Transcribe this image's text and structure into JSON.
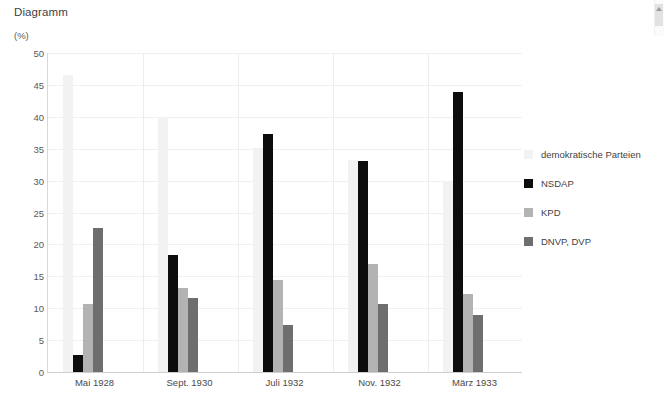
{
  "chart_title": "Diagramm",
  "scrollbar": {
    "up_arrow_icon": "chevron-up-icon"
  },
  "chart_data": {
    "type": "bar",
    "title": "Diagramm",
    "xlabel": "",
    "ylabel": "(%)",
    "ylim": [
      0,
      50
    ],
    "yticks": [
      0,
      5,
      10,
      15,
      20,
      25,
      30,
      35,
      40,
      45,
      50
    ],
    "ytick_labels": [
      "0",
      "5",
      "10",
      "15",
      "20",
      "25",
      "30",
      "35",
      "40",
      "45",
      "50"
    ],
    "grid": true,
    "legend_position": "right",
    "categories": [
      "Mai 1928",
      "Sept. 1930",
      "Juli 1932",
      "Nov. 1932",
      "März 1933"
    ],
    "series": [
      {
        "name": "demokratische Parteien",
        "color": "#f2f2f2",
        "values": [
          46.5,
          40.0,
          35.1,
          33.2,
          30.0
        ]
      },
      {
        "name": "NSDAP",
        "color": "#0d0d0d",
        "values": [
          2.6,
          18.3,
          37.3,
          33.1,
          43.9
        ]
      },
      {
        "name": "KPD",
        "color": "#b3b3b3",
        "values": [
          10.6,
          13.1,
          14.5,
          16.9,
          12.3
        ]
      },
      {
        "name": "DNVP, DVP",
        "color": "#6e6e6e",
        "values": [
          22.5,
          11.6,
          7.3,
          10.6,
          8.9
        ]
      }
    ]
  }
}
